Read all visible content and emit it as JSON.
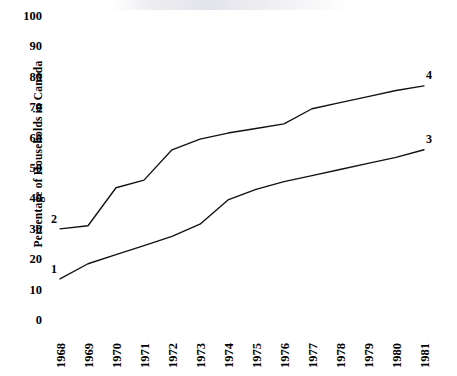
{
  "chart_data": {
    "type": "line",
    "title": "",
    "xlabel": "",
    "ylabel": "Percentage of Households in Canada",
    "x": [
      1968,
      1969,
      1970,
      1971,
      1972,
      1973,
      1974,
      1975,
      1976,
      1977,
      1978,
      1979,
      1980,
      1981
    ],
    "xtick_labels": [
      "1968",
      "1969",
      "1970",
      "1971",
      "1972",
      "1973",
      "1974",
      "1975",
      "1976",
      "1977",
      "1978",
      "1979",
      "1980",
      "1981"
    ],
    "ytick_labels": [
      "0",
      "10",
      "20",
      "30",
      "40",
      "50",
      "60",
      "70",
      "80",
      "90",
      "100"
    ],
    "ylim": [
      0,
      100
    ],
    "xlim": [
      1968,
      1981
    ],
    "grid": false,
    "legend_position": "line-end-labels",
    "series": [
      {
        "name": "1",
        "label_left": "1",
        "label_right": "3",
        "values": [
          13.5,
          18.5,
          21.5,
          24.5,
          27.5,
          31.5,
          39.5,
          43.0,
          45.5,
          47.5,
          49.5,
          51.5,
          53.5,
          56.0
        ]
      },
      {
        "name": "2",
        "label_left": "2",
        "label_right": "4",
        "values": [
          30.0,
          31.0,
          43.5,
          46.0,
          56.0,
          59.5,
          61.5,
          63.0,
          64.5,
          69.5,
          71.5,
          73.5,
          75.5,
          77.0
        ]
      }
    ],
    "colors": {
      "line": "#111111",
      "text": "#000000",
      "background": "#ffffff"
    }
  }
}
